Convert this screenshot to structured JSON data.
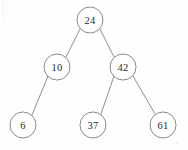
{
  "figure": {
    "type": "binary-search-tree",
    "width": 188,
    "height": 150,
    "background_color": "#fefefe",
    "edge_color": "#8d8d8d",
    "node_stroke_color": "#8a8a8a",
    "node_fill_color": "#ffffff",
    "label_color": "#2b2b2b",
    "node_radius": 13
  },
  "nodes": [
    {
      "id": "n24",
      "label": "24",
      "cx": 90,
      "cy": 20,
      "level": 0,
      "role": "root"
    },
    {
      "id": "n10",
      "label": "10",
      "cx": 57,
      "cy": 67,
      "level": 1,
      "role": "left-child"
    },
    {
      "id": "n42",
      "label": "42",
      "cx": 123,
      "cy": 67,
      "level": 1,
      "role": "right-child"
    },
    {
      "id": "n6",
      "label": "6",
      "cx": 23,
      "cy": 125,
      "level": 2,
      "role": "leaf"
    },
    {
      "id": "n37",
      "label": "37",
      "cx": 93,
      "cy": 125,
      "level": 2,
      "role": "leaf"
    },
    {
      "id": "n61",
      "label": "61",
      "cx": 163,
      "cy": 125,
      "level": 2,
      "role": "leaf"
    }
  ],
  "edges": [
    {
      "id": "e24-10",
      "from": "n24",
      "to": "n10",
      "x1": 80,
      "y1": 29,
      "x2": 66,
      "y2": 57
    },
    {
      "id": "e24-42",
      "from": "n24",
      "to": "n42",
      "x1": 100,
      "y1": 29,
      "x2": 114,
      "y2": 57
    },
    {
      "id": "e10-6",
      "from": "n10",
      "to": "n6",
      "x1": 48,
      "y1": 76,
      "x2": 32,
      "y2": 115
    },
    {
      "id": "e42-37",
      "from": "n42",
      "to": "n37",
      "x1": 114,
      "y1": 76,
      "x2": 101,
      "y2": 114
    },
    {
      "id": "e42-61",
      "from": "n42",
      "to": "n61",
      "x1": 133,
      "y1": 76,
      "x2": 155,
      "y2": 114
    }
  ]
}
